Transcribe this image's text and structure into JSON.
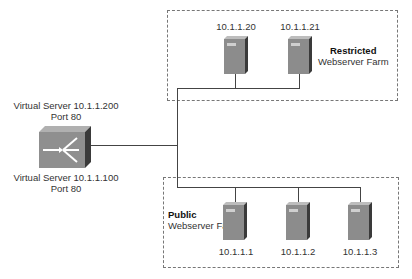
{
  "diagram": {
    "load_balancer": {
      "icon": "content-switch-icon",
      "virtual_servers": [
        {
          "line1": "Virtual Server 10.1.1.200",
          "line2": "Port 80"
        },
        {
          "line1": "Virtual Server 10.1.1.100",
          "line2": "Port 80"
        }
      ]
    },
    "zones": [
      {
        "id": "restricted",
        "title": "Restricted",
        "subtitle": "Webserver Farm",
        "servers": [
          {
            "ip": "10.1.1.20",
            "icon": "server-icon"
          },
          {
            "ip": "10.1.1.21",
            "icon": "server-icon"
          }
        ]
      },
      {
        "id": "public",
        "title": "Public",
        "subtitle": "Webserver Farm",
        "servers": [
          {
            "ip": "10.1.1.1",
            "icon": "server-icon"
          },
          {
            "ip": "10.1.1.2",
            "icon": "server-icon"
          },
          {
            "ip": "10.1.1.3",
            "icon": "server-icon"
          }
        ]
      }
    ],
    "colors": {
      "server_front": "#8c8c8c",
      "server_side": "#3a3a3a",
      "switch_body": "#8f8f8f",
      "line": "#444444",
      "dash": "#777777"
    }
  }
}
